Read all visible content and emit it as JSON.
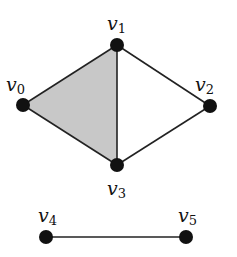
{
  "diagram": {
    "type": "simplicial-complex",
    "colors": {
      "fill": "#c8c8c8",
      "edge": "#222222",
      "vertex": "#111111"
    },
    "vertices": [
      {
        "id": "v0",
        "base": "v",
        "index": "0",
        "x": 23,
        "y": 105,
        "lx": 6,
        "ly": 91
      },
      {
        "id": "v1",
        "base": "v",
        "index": "1",
        "x": 117,
        "y": 45,
        "lx": 107,
        "ly": 30
      },
      {
        "id": "v2",
        "base": "v",
        "index": "2",
        "x": 210,
        "y": 106,
        "lx": 195,
        "ly": 91
      },
      {
        "id": "v3",
        "base": "v",
        "index": "3",
        "x": 117,
        "y": 165,
        "lx": 107,
        "ly": 195
      },
      {
        "id": "v4",
        "base": "v",
        "index": "4",
        "x": 46,
        "y": 237,
        "lx": 38,
        "ly": 222
      },
      {
        "id": "v5",
        "base": "v",
        "index": "5",
        "x": 186,
        "y": 237,
        "lx": 178,
        "ly": 222
      }
    ],
    "edges": [
      [
        "v0",
        "v1"
      ],
      [
        "v0",
        "v3"
      ],
      [
        "v1",
        "v3"
      ],
      [
        "v1",
        "v2"
      ],
      [
        "v2",
        "v3"
      ],
      [
        "v4",
        "v5"
      ]
    ],
    "faces": [
      [
        "v0",
        "v1",
        "v3"
      ]
    ]
  }
}
